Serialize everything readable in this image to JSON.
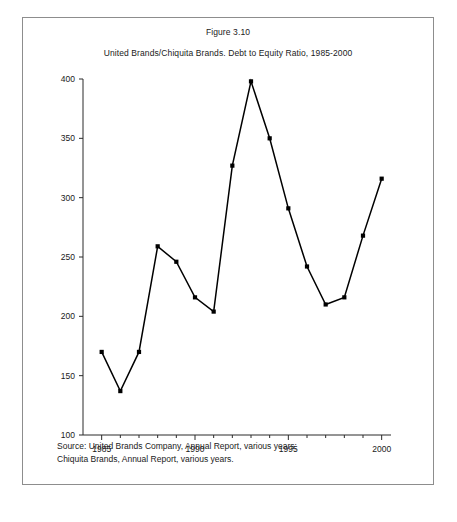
{
  "figure": {
    "number": "Figure 3.10",
    "title": "United Brands/Chiquita Brands. Debt to Equity Ratio, 1985-2000",
    "source": "Source: United Brands Company, Annual Report, various years;\nChiquita Brands, Annual Report, various years."
  },
  "chart_data": {
    "type": "line",
    "title": "United Brands/Chiquita Brands. Debt to Equity Ratio, 1985-2000",
    "xlabel": "",
    "ylabel": "",
    "x": [
      1985,
      1986,
      1987,
      1988,
      1989,
      1990,
      1991,
      1992,
      1993,
      1994,
      1995,
      1996,
      1997,
      1998,
      1999
    ],
    "values": [
      170,
      137,
      170,
      259,
      246,
      216,
      204,
      327,
      398,
      350,
      291,
      242,
      210,
      216,
      268
    ],
    "series": [
      {
        "name": "Debt to Equity Ratio",
        "points": [
          {
            "x": 1985,
            "y": 170
          },
          {
            "x": 1986,
            "y": 137
          },
          {
            "x": 1987,
            "y": 170
          },
          {
            "x": 1988,
            "y": 259
          },
          {
            "x": 1989,
            "y": 246
          },
          {
            "x": 1990,
            "y": 216
          },
          {
            "x": 1991,
            "y": 204
          },
          {
            "x": 1992,
            "y": 327
          },
          {
            "x": 1993,
            "y": 398
          },
          {
            "x": 1994,
            "y": 350
          },
          {
            "x": 1995,
            "y": 291
          },
          {
            "x": 1996,
            "y": 242
          },
          {
            "x": 1997,
            "y": 210
          },
          {
            "x": 1998,
            "y": 216
          },
          {
            "x": 1999,
            "y": 268
          },
          {
            "x": 2000,
            "y": 316
          }
        ]
      }
    ],
    "xlim": [
      1984.0,
      2000.5
    ],
    "ylim": [
      100,
      400
    ],
    "ytick_values": [
      100,
      150,
      200,
      250,
      300,
      350,
      400
    ],
    "ytick_labels": [
      "100",
      "150",
      "200",
      "250",
      "300",
      "350",
      "400"
    ],
    "xtick_major_values": [
      1985,
      1990,
      1995,
      2000
    ],
    "xtick_major_labels": [
      "1985",
      "1990",
      "1995",
      "2000"
    ],
    "xtick_minor_values": [
      1986,
      1987,
      1988,
      1989,
      1991,
      1992,
      1993,
      1994,
      1996,
      1997,
      1998,
      1999
    ],
    "grid": false,
    "legend": false,
    "marker": "square",
    "line_color": "#000000"
  },
  "colors": {
    "frame": "#8d8d8d",
    "axis": "#2b2b2b",
    "line": "#000000",
    "background": "#ffffff"
  }
}
